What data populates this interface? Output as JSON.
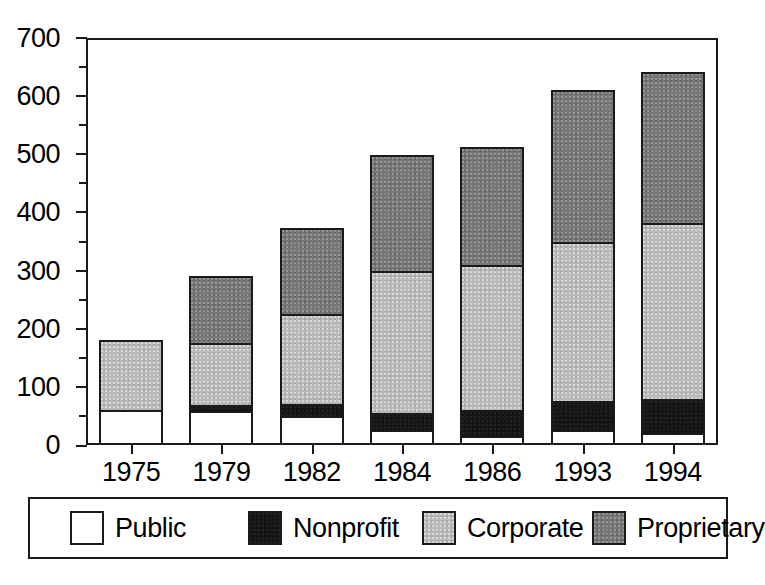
{
  "chart_data": {
    "type": "bar",
    "subtype": "stacked-vertical",
    "title": "",
    "xlabel": "",
    "ylabel": "",
    "categories": [
      "1975",
      "1979",
      "1982",
      "1984",
      "1986",
      "1993",
      "1994"
    ],
    "series": [
      {
        "name": "Public",
        "color": "#ffffff",
        "values": [
          60,
          58,
          50,
          25,
          15,
          25,
          20
        ]
      },
      {
        "name": "Nonprofit",
        "color": "#131313",
        "values": [
          0,
          10,
          20,
          30,
          45,
          50,
          60
        ]
      },
      {
        "name": "Corporate",
        "color": "#b9b9b9",
        "values": [
          120,
          107,
          155,
          245,
          250,
          275,
          302
        ]
      },
      {
        "name": "Proprietary",
        "color": "#777777",
        "values": [
          0,
          115,
          148,
          198,
          202,
          260,
          260
        ]
      }
    ],
    "totals": [
      180,
      290,
      373,
      498,
      512,
      610,
      642
    ],
    "ylim": [
      0,
      700
    ],
    "ytick_major": [
      0,
      100,
      200,
      300,
      400,
      500,
      600,
      700
    ],
    "ytick_minor": [
      50,
      150,
      250,
      350,
      450,
      550,
      650
    ],
    "ytick_labels": [
      "0",
      "100",
      "200",
      "300",
      "400",
      "500",
      "600",
      "700"
    ],
    "grid": false,
    "legend_position": "bottom",
    "legend_entries": [
      "Public",
      "Nonprofit",
      "Corporate",
      "Proprietary"
    ]
  },
  "legend": {
    "items": [
      {
        "label": "Public",
        "swatch": "white-swatch-icon",
        "left": 40,
        "fill": "fill-public"
      },
      {
        "label": "Nonprofit",
        "swatch": "black-swatch-icon",
        "left": 218,
        "fill": "fill-nonprofit"
      },
      {
        "label": "Corporate",
        "swatch": "lightgray-swatch-icon",
        "left": 392,
        "fill": "fill-corporate"
      },
      {
        "label": "Proprietary",
        "swatch": "darkgray-swatch-icon",
        "left": 562,
        "fill": "fill-proprietary"
      }
    ]
  },
  "colors": {
    "axis": "#1a1a1a",
    "background": "#ffffff",
    "public": "#ffffff",
    "nonprofit": "#131313",
    "corporate": "#b9b9b9",
    "proprietary": "#777777"
  }
}
